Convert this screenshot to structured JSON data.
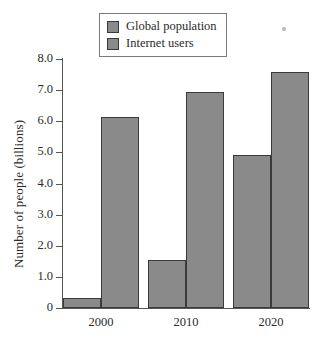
{
  "chart_data": {
    "type": "bar",
    "title": "",
    "xlabel": "",
    "ylabel": "Number of people (billions)",
    "categories": [
      "2000",
      "2010",
      "2020"
    ],
    "series": [
      {
        "name": "Global population",
        "values": [
          0.33,
          1.55,
          4.9
        ]
      },
      {
        "name": "Internet users",
        "values": [
          6.1,
          6.9,
          7.55
        ]
      }
    ],
    "ylim": [
      0,
      8.0
    ],
    "yticks": [
      "0",
      "1.0",
      "2.0",
      "3.0",
      "4.0",
      "5.0",
      "6.0",
      "7.0",
      "8.0"
    ],
    "ytick_values": [
      0,
      1,
      2,
      3,
      4,
      5,
      6,
      7,
      8
    ],
    "grid": false,
    "legend_position": "top-center",
    "bar_color": "#8a8a8a",
    "bar_edge_color": "#3a3a3a",
    "axis_color": "#555555",
    "background": "#ffffff"
  },
  "legend": {
    "items": [
      {
        "label": "Global population",
        "color": "#8a8a8a"
      },
      {
        "label": "Internet users",
        "color": "#8a8a8a"
      }
    ]
  }
}
